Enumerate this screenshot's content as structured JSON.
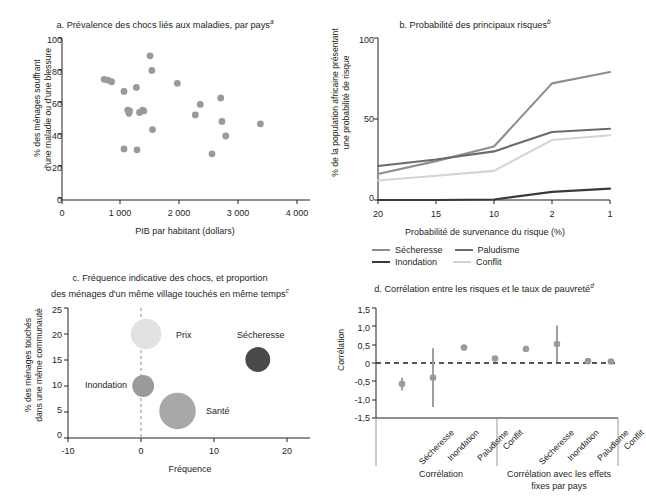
{
  "figure": {
    "background": "#ffffff",
    "text_color": "#231f20"
  },
  "panel_a": {
    "title": "a. Prévalence des chocs liés aux maladies, par pays",
    "title_sup": "a",
    "ylabel_line1": "% des ménages souffrant",
    "ylabel_line2": "d'une maladie ou d'une blessure",
    "xlabel": "PIB par habitant (dollars)",
    "yticks": [
      "100",
      "80",
      "60",
      "40",
      "20",
      "0"
    ],
    "xticks": [
      "0",
      "1 000",
      "2 000",
      "3 000",
      "4 000"
    ],
    "point_color": "#9a9a9a"
  },
  "panel_b": {
    "title": "b. Probabilité des principaux risques",
    "title_sup": "b",
    "ylabel_line1": "% de la population africaine présentant",
    "ylabel_line2": "une probabilité de risque",
    "xlabel": "Probabilité de survenance du risque (%)",
    "yticks": [
      "100",
      "50",
      "0"
    ],
    "xticks": [
      "20",
      "15",
      "10",
      "2",
      "1"
    ],
    "legend": [
      {
        "label": "Sécheresse",
        "color": "#8e8e8e"
      },
      {
        "label": "Paludisme",
        "color": "#6b6b6b"
      },
      {
        "label": "Inondation",
        "color": "#3a3a3a"
      },
      {
        "label": "Conflit",
        "color": "#d3d3d3"
      }
    ]
  },
  "panel_c": {
    "title_line1": "c. Fréquence indicative des chocs, et proportion",
    "title_line2": "des ménages d'un même village touchés en même temps",
    "title_sup": "c",
    "ylabel_line1": "% des ménages touchés",
    "ylabel_line2": "dans une même communauté",
    "xlabel": "Fréquence",
    "yticks": [
      "25",
      "20",
      "15",
      "10",
      "5",
      "0"
    ],
    "xticks": [
      "-10",
      "0",
      "10",
      "20"
    ],
    "bubble_labels": [
      "Prix",
      "Sécheresse",
      "Inondation",
      "Santé"
    ]
  },
  "panel_d": {
    "title": "d. Corrélation entre les risques et le taux de pauvreté",
    "title_sup": "d",
    "ylabel": "Corrélation",
    "yticks": [
      "1,5",
      "1,0",
      "0,5",
      "0",
      "-0,5",
      "-1,0",
      "-1,5"
    ],
    "category_labels": [
      "Sécheresse",
      "Inondation",
      "Paludisme",
      "Conflit",
      "Sécheresse",
      "Inondation",
      "Paludisme",
      "Conflit"
    ],
    "group_label_1": "Corrélation",
    "group_label_2_line1": "Corrélation avec les effets",
    "group_label_2_line2": "fixes par pays",
    "marker_color": "#9a9a9a"
  },
  "chart_data": [
    {
      "panel": "a",
      "type": "scatter",
      "title": "a. Prévalence des chocs liés aux maladies, par pays",
      "xlabel": "PIB par habitant (dollars)",
      "ylabel": "% des ménages souffrant d'une maladie ou d'une blessure",
      "xlim": [
        0,
        4000
      ],
      "ylim": [
        0,
        100
      ],
      "xticks": [
        0,
        1000,
        2000,
        3000,
        4000
      ],
      "yticks": [
        0,
        20,
        40,
        60,
        80,
        100
      ],
      "grid": false,
      "points": [
        {
          "x": 680,
          "y": 74.5
        },
        {
          "x": 740,
          "y": 74.0
        },
        {
          "x": 800,
          "y": 73.0
        },
        {
          "x": 1000,
          "y": 67.0
        },
        {
          "x": 1000,
          "y": 31.5
        },
        {
          "x": 1060,
          "y": 55.5
        },
        {
          "x": 1080,
          "y": 53.5
        },
        {
          "x": 1090,
          "y": 55.0
        },
        {
          "x": 1200,
          "y": 69.5
        },
        {
          "x": 1210,
          "y": 31.0
        },
        {
          "x": 1250,
          "y": 54.0
        },
        {
          "x": 1300,
          "y": 55.5
        },
        {
          "x": 1320,
          "y": 55.0
        },
        {
          "x": 1420,
          "y": 89.0
        },
        {
          "x": 1450,
          "y": 80.0
        },
        {
          "x": 1460,
          "y": 43.5
        },
        {
          "x": 1860,
          "y": 72.0
        },
        {
          "x": 2150,
          "y": 52.5
        },
        {
          "x": 2230,
          "y": 59.0
        },
        {
          "x": 2420,
          "y": 28.5
        },
        {
          "x": 2560,
          "y": 63.0
        },
        {
          "x": 2580,
          "y": 48.5
        },
        {
          "x": 2640,
          "y": 39.5
        },
        {
          "x": 3200,
          "y": 47.0
        }
      ]
    },
    {
      "panel": "b",
      "type": "line",
      "title": "b. Probabilité des principaux risques",
      "xlabel": "Probabilité de survenance du risque (%)",
      "ylabel": "% de la population africaine présentant une probabilité de risque",
      "x": [
        "20",
        "15",
        "10",
        "2",
        "1"
      ],
      "ylim": [
        0,
        100
      ],
      "yticks": [
        0,
        50,
        100
      ],
      "grid": false,
      "legend_position": "bottom",
      "series": [
        {
          "name": "Sécheresse",
          "color": "#8e8e8e",
          "values": [
            16,
            24,
            33,
            72,
            79
          ]
        },
        {
          "name": "Paludisme",
          "color": "#6b6b6b",
          "values": [
            21,
            25,
            30,
            42,
            44
          ]
        },
        {
          "name": "Conflit",
          "color": "#d3d3d3",
          "values": [
            12,
            15,
            18,
            37,
            40
          ]
        },
        {
          "name": "Inondation",
          "color": "#3a3a3a",
          "values": [
            0,
            0,
            0.3,
            5,
            7
          ]
        }
      ]
    },
    {
      "panel": "c",
      "type": "scatter",
      "title": "c. Fréquence indicative des chocs, et proportion des ménages d'un même village touchés en même temps",
      "xlabel": "Fréquence",
      "ylabel": "% des ménages touchés dans une même communauté",
      "xlim": [
        -10,
        20
      ],
      "ylim": [
        0,
        25
      ],
      "xticks": [
        -10,
        0,
        10,
        20
      ],
      "yticks": [
        0,
        5,
        10,
        15,
        20,
        25
      ],
      "grid": false,
      "reference_line_x": 0,
      "bubbles": [
        {
          "label": "Prix",
          "x": 0.7,
          "y": 20.0,
          "r": 2.1,
          "color": "#e2e2e2"
        },
        {
          "label": "Sécheresse",
          "x": 16.0,
          "y": 15.1,
          "r": 1.7,
          "color": "#494949"
        },
        {
          "label": "Inondation",
          "x": 0.3,
          "y": 10.0,
          "r": 1.5,
          "color": "#9a9a9a"
        },
        {
          "label": "Santé",
          "x": 5.0,
          "y": 5.2,
          "r": 2.5,
          "color": "#a8a8a8"
        }
      ]
    },
    {
      "panel": "d",
      "type": "scatter",
      "title": "d. Corrélation entre les risques et le taux de pauvreté",
      "ylabel": "Corrélation",
      "ylim": [
        -1.5,
        1.5
      ],
      "yticks": [
        -1.5,
        -1.0,
        -0.5,
        0,
        0.5,
        1.0,
        1.5
      ],
      "grid": false,
      "reference_line_y": 0,
      "categories": [
        "Sécheresse",
        "Inondation",
        "Paludisme",
        "Conflit",
        "Sécheresse",
        "Inondation",
        "Paludisme",
        "Conflit"
      ],
      "groups": [
        "Corrélation",
        "Corrélation avec les effets fixes par pays"
      ],
      "values": [
        -0.57,
        -0.4,
        0.42,
        0.12,
        0.38,
        0.52,
        0.05,
        0.04
      ],
      "ci_low": [
        -0.75,
        -1.2,
        0.36,
        0.06,
        0.3,
        0.03,
        0.02,
        0.01
      ],
      "ci_high": [
        -0.4,
        0.4,
        0.48,
        0.18,
        0.47,
        1.02,
        0.08,
        0.07
      ]
    }
  ]
}
